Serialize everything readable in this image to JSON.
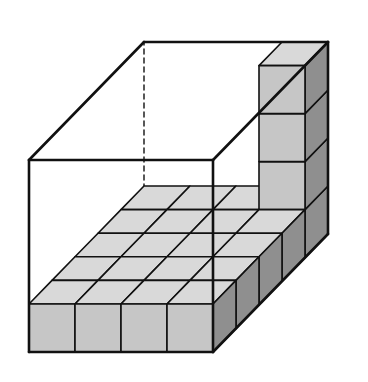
{
  "diagram": {
    "box": {
      "width_cubes": 4,
      "depth_cubes": 5,
      "height_cubes": 4
    },
    "floor_layer": {
      "width": 4,
      "depth": 5,
      "layers": 1
    },
    "column": {
      "position": "back-right corner",
      "extra_cubes": 3
    },
    "colors": {
      "background": "#ffffff",
      "edge": "#111111",
      "top_face": "#d9d9d9",
      "front_face": "#c6c6c6",
      "side_face": "#8f8f8f"
    },
    "geometry": {
      "origin_x": 29,
      "origin_y": 352,
      "unit_w": 46,
      "unit_h": 48,
      "depth_dx": 23,
      "depth_dy": -23.6
    }
  }
}
